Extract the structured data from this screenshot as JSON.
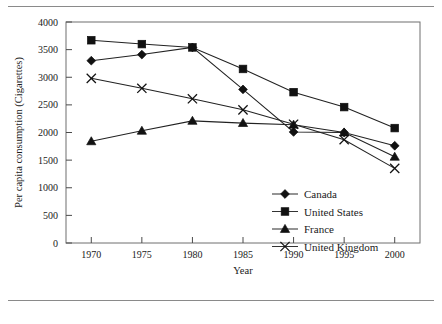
{
  "chart_data": {
    "type": "line",
    "title": "",
    "xlabel": "Year",
    "ylabel": "Per capita consumption (Cigarettes)",
    "x": [
      1970,
      1975,
      1980,
      1985,
      1990,
      1995,
      2000
    ],
    "xlim": [
      1967.5,
      2002.5
    ],
    "ylim": [
      0,
      4000
    ],
    "ytick_labels": [
      "0",
      "500",
      "1000",
      "1500",
      "2000",
      "2500",
      "3000",
      "3500",
      "4000"
    ],
    "yticks": [
      0,
      500,
      1000,
      1500,
      2000,
      2500,
      3000,
      3500,
      4000
    ],
    "xtick_labels": [
      "1970",
      "1975",
      "1980",
      "1985",
      "1990",
      "1995",
      "2000"
    ],
    "grid": false,
    "legend_position": "lower right",
    "series": [
      {
        "name": "Canada",
        "marker": "diamond",
        "values": [
          3300,
          3410,
          3540,
          2780,
          2010,
          2000,
          1760
        ]
      },
      {
        "name": "United States",
        "marker": "square",
        "values": [
          3670,
          3600,
          3540,
          3150,
          2730,
          2460,
          2080
        ]
      },
      {
        "name": "France",
        "marker": "triangle",
        "values": [
          1840,
          2030,
          2210,
          2170,
          2140,
          2000,
          1560
        ]
      },
      {
        "name": "United Kingdom",
        "marker": "cross",
        "values": [
          2980,
          2800,
          2610,
          2410,
          2150,
          1870,
          1350
        ]
      }
    ]
  }
}
